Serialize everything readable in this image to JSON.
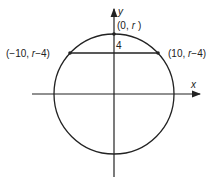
{
  "diagram": {
    "axes": {
      "x_label": "x",
      "y_label": "y"
    },
    "points": {
      "top": {
        "label_open": "(0,",
        "label_var": "r",
        "label_close": ")"
      },
      "left": {
        "label": "(−10, ",
        "label_var": "r",
        "label_tail": "−4)"
      },
      "right": {
        "label": "(10, ",
        "label_var": "r",
        "label_tail": "−4)"
      }
    },
    "segment_label": "4",
    "colors": {
      "stroke": "#222222",
      "background": "#ffffff"
    }
  }
}
